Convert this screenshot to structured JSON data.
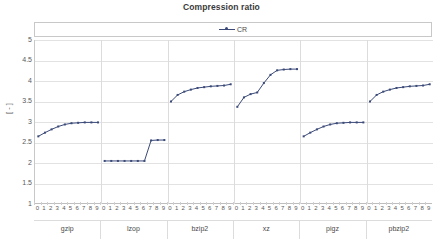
{
  "chart_data": {
    "type": "line",
    "title": "Compression ratio",
    "xlabel": "",
    "ylabel": "[ - ]",
    "ylim": [
      1,
      5
    ],
    "ytick_values": [
      1,
      1.5,
      2,
      2.5,
      3,
      3.5,
      4,
      4.5,
      5
    ],
    "ytick_labels": [
      "1",
      "1.5",
      "2",
      "2.5",
      "3",
      "3.5",
      "4",
      "4.5",
      "5"
    ],
    "grid": true,
    "legend_position": "top",
    "legend": [
      "CR"
    ],
    "series_color": "#3b4a78",
    "x_tick_labels": [
      "0",
      "1",
      "2",
      "3",
      "4",
      "5",
      "6",
      "7",
      "8",
      "9"
    ],
    "groups": [
      {
        "name": "gzip",
        "x": [
          0,
          1,
          2,
          3,
          4,
          5,
          6,
          7,
          8,
          9
        ],
        "values": [
          2.65,
          2.74,
          2.82,
          2.89,
          2.94,
          2.97,
          2.98,
          2.99,
          2.99,
          2.99
        ]
      },
      {
        "name": "lzop",
        "x": [
          0,
          1,
          2,
          3,
          4,
          5,
          6,
          7,
          8,
          9
        ],
        "values": [
          2.05,
          2.05,
          2.05,
          2.05,
          2.05,
          2.05,
          2.05,
          2.55,
          2.56,
          2.56
        ]
      },
      {
        "name": "bzip2",
        "x": [
          0,
          1,
          2,
          3,
          4,
          5,
          6,
          7,
          8,
          9
        ],
        "values": [
          3.5,
          3.66,
          3.74,
          3.79,
          3.83,
          3.85,
          3.87,
          3.88,
          3.89,
          3.92
        ]
      },
      {
        "name": "xz",
        "x": [
          0,
          1,
          2,
          3,
          4,
          5,
          6,
          7,
          8,
          9
        ],
        "values": [
          3.37,
          3.6,
          3.68,
          3.72,
          3.95,
          4.15,
          4.26,
          4.28,
          4.29,
          4.29
        ]
      },
      {
        "name": "pigz",
        "x": [
          0,
          1,
          2,
          3,
          4,
          5,
          6,
          7,
          8,
          9
        ],
        "values": [
          2.65,
          2.74,
          2.82,
          2.89,
          2.94,
          2.97,
          2.98,
          2.99,
          2.99,
          2.99
        ]
      },
      {
        "name": "pbzip2",
        "x": [
          0,
          1,
          2,
          3,
          4,
          5,
          6,
          7,
          8,
          9
        ],
        "values": [
          3.5,
          3.66,
          3.74,
          3.79,
          3.83,
          3.85,
          3.87,
          3.88,
          3.89,
          3.92
        ]
      }
    ]
  }
}
